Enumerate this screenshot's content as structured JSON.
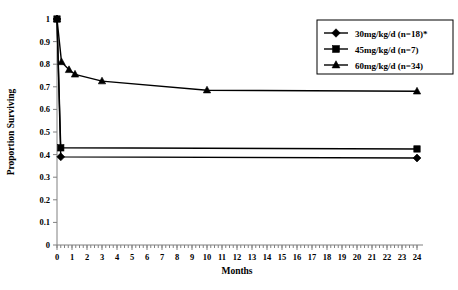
{
  "chart_data": {
    "type": "line",
    "title": "",
    "xlabel": "Months",
    "ylabel": "Proportion Surviving",
    "xlim": [
      0,
      24
    ],
    "ylim": [
      0,
      1
    ],
    "grid": false,
    "legend_position": "top-right",
    "x_ticks": [
      0,
      1,
      2,
      3,
      4,
      5,
      6,
      7,
      8,
      9,
      10,
      11,
      12,
      13,
      14,
      15,
      16,
      17,
      18,
      19,
      20,
      21,
      22,
      23,
      24
    ],
    "x_tick_labels": [
      "0",
      "1",
      "2",
      "3",
      "4",
      "5",
      "6",
      "7",
      "8",
      "9",
      "10",
      "11",
      "12",
      "13",
      "14",
      "15",
      "16",
      "17",
      "18",
      "19",
      "20",
      "21",
      "22",
      "23",
      "24"
    ],
    "x_minor_tick_interval": 0.25,
    "y_ticks": [
      0,
      0.1,
      0.2,
      0.3,
      0.4,
      0.5,
      0.6,
      0.7,
      0.8,
      0.9,
      1
    ],
    "y_tick_labels": [
      "0",
      "0.1",
      "0.2",
      "0.3",
      "0.4",
      "0.5",
      "0.6",
      "0.7",
      "0.8",
      "0.9",
      "1"
    ],
    "series": [
      {
        "name": "30mg/kg/d (n=18)*",
        "marker": "diamond",
        "color": "#000000",
        "x": [
          0,
          0.25,
          24
        ],
        "values": [
          1,
          0.39,
          0.385
        ]
      },
      {
        "name": "45mg/kg/d (n=7)",
        "marker": "square",
        "color": "#000000",
        "x": [
          0,
          0.25,
          24
        ],
        "values": [
          1,
          0.43,
          0.425
        ]
      },
      {
        "name": "60mg/kg/d (n=34)",
        "marker": "triangle",
        "color": "#000000",
        "x": [
          0,
          0.3,
          0.8,
          1.2,
          3,
          10,
          24
        ],
        "values": [
          1,
          0.81,
          0.775,
          0.755,
          0.725,
          0.685,
          0.68
        ]
      }
    ]
  },
  "legend": {
    "entries": [
      {
        "label": "30mg/kg/d (n=18)*",
        "marker": "diamond"
      },
      {
        "label": "45mg/kg/d (n=7)",
        "marker": "square"
      },
      {
        "label": "60mg/kg/d (n=34)",
        "marker": "triangle"
      }
    ]
  },
  "axes": {
    "x_title": "Months",
    "y_title": "Proportion Surviving"
  }
}
